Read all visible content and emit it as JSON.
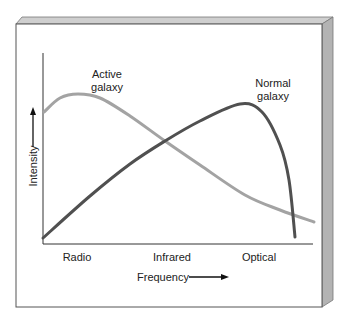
{
  "chart_data": {
    "type": "line",
    "title": "",
    "xlabel": "Frequency",
    "ylabel": "Intensity",
    "x_categories": [
      "Radio",
      "Infrared",
      "Optical"
    ],
    "x_category_positions_px": [
      77,
      172,
      259
    ],
    "axis_arrows": true,
    "grid": false,
    "legend_position": "inline",
    "series": [
      {
        "name": "Active galaxy",
        "label_lines": [
          "Active",
          "galaxy"
        ],
        "color": "#a3a3a3",
        "description": "Peaks early at radio frequencies then declines steadily toward optical",
        "points_px": [
          [
            44,
            112
          ],
          [
            60,
            98
          ],
          [
            78,
            94
          ],
          [
            100,
            98
          ],
          [
            130,
            116
          ],
          [
            165,
            141
          ],
          [
            200,
            165
          ],
          [
            245,
            195
          ],
          [
            280,
            210
          ],
          [
            314,
            222
          ]
        ]
      },
      {
        "name": "Normal galaxy",
        "label_lines": [
          "Normal",
          "galaxy"
        ],
        "color": "#505050",
        "description": "Rises from low radio intensity, peaks near optical, then drops sharply",
        "points_px": [
          [
            43,
            238
          ],
          [
            90,
            196
          ],
          [
            130,
            164
          ],
          [
            165,
            141
          ],
          [
            200,
            121
          ],
          [
            240,
            104
          ],
          [
            262,
            112
          ],
          [
            280,
            145
          ],
          [
            289,
            180
          ],
          [
            295,
            237
          ]
        ]
      }
    ]
  },
  "colors": {
    "panel_face": "#ffffff",
    "panel_border": "#555555",
    "bevel_top": "#cfcfcf",
    "bevel_right": "#b3b3b3",
    "axis": "#333333",
    "text": "#222222"
  }
}
